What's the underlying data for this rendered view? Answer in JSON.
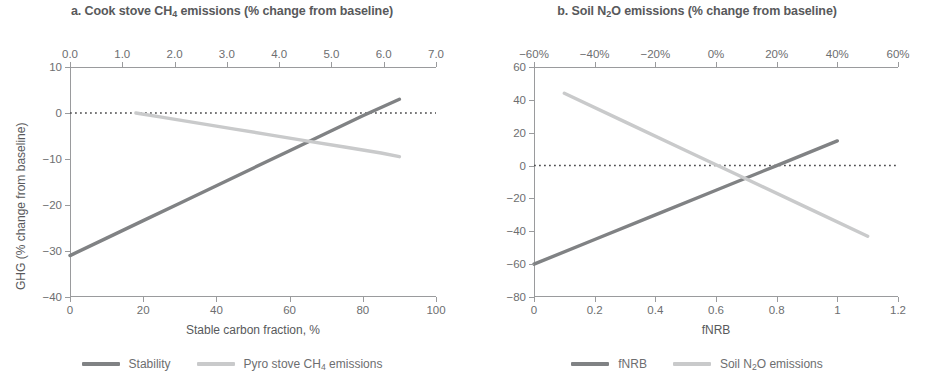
{
  "colors": {
    "series_dark": "#808284",
    "series_light": "#c9cacb",
    "axis": "#9a9b9d",
    "text": "#6d6e70",
    "title": "#58595b",
    "zero_line": "#4d4d4f",
    "background": "#ffffff"
  },
  "panels": [
    {
      "id": "a",
      "title_prefix": "a. Cook stove CH",
      "title_sub": "4",
      "title_suffix": " emissions (% change from baseline)",
      "title_full": "a. Cook stove CH4 emissions (% change from baseline)",
      "top_axis_ticks": [
        "0.0",
        "1.0",
        "2.0",
        "3.0",
        "4.0",
        "5.0",
        "6.0",
        "7.0"
      ],
      "bottom_axis_ticks": [
        "0",
        "20",
        "40",
        "60",
        "80",
        "100"
      ],
      "y_axis_ticks": [
        "10",
        "0",
        "-10",
        "-20",
        "-30",
        "-40"
      ],
      "x_axis_title": "Stable carbon fraction, %",
      "y_axis_title": "GHG (% change from baseline)",
      "legend": [
        {
          "label": "Stability",
          "color": "#808284",
          "style": "solid"
        },
        {
          "label_prefix": "Pyro stove CH",
          "label_sub": "4",
          "label_suffix": " emissions",
          "label": "Pyro stove CH4 emissions",
          "color": "#c9cacb",
          "style": "solid"
        }
      ]
    },
    {
      "id": "b",
      "title_prefix": "b. Soil N",
      "title_sub": "2",
      "title_suffix": "O emissions (% change from baseline)",
      "title_full": "b. Soil N2O emissions (% change from baseline)",
      "top_axis_ticks": [
        "-60%",
        "-40%",
        "-20%",
        "0%",
        "20%",
        "40%",
        "60%"
      ],
      "bottom_axis_ticks": [
        "0",
        "0.2",
        "0.4",
        "0.6",
        "0.8",
        "1",
        "1.2"
      ],
      "y_axis_ticks": [
        "60",
        "40",
        "20",
        "0",
        "-20",
        "-40",
        "-60",
        "-80"
      ],
      "x_axis_title": "fNRB",
      "y_axis_title": "GHG (% change from baseline)",
      "legend": [
        {
          "label": "fNRB",
          "color": "#808284",
          "style": "solid"
        },
        {
          "label_prefix": "Soil N",
          "label_sub": "2",
          "label_suffix": "O emissions",
          "label": "Soil N2O emissions",
          "color": "#c9cacb",
          "style": "solid"
        }
      ]
    }
  ],
  "chart_data": [
    {
      "type": "line",
      "panel": "a",
      "title": "a. Cook stove CH4 emissions (% change from baseline)",
      "xlabel": "Stable carbon fraction, %",
      "ylabel": "GHG (% change from baseline)",
      "xlim": [
        0,
        100
      ],
      "ylim": [
        -40,
        10
      ],
      "xticks": [
        0,
        20,
        40,
        60,
        80,
        100
      ],
      "yticks": [
        -40,
        -30,
        -20,
        -10,
        0,
        10
      ],
      "secondary_xaxis": {
        "position": "top",
        "lim": [
          0.0,
          7.0
        ],
        "ticks": [
          0.0,
          1.0,
          2.0,
          3.0,
          4.0,
          5.0,
          6.0,
          7.0
        ],
        "ticklabels": [
          "0.0",
          "1.0",
          "2.0",
          "3.0",
          "4.0",
          "5.0",
          "6.0",
          "7.0"
        ]
      },
      "grid": false,
      "legend_position": "bottom",
      "zero_reference_line": {
        "y": 0,
        "style": "dotted",
        "color": "#4d4d4f"
      },
      "series": [
        {
          "name": "Stability",
          "color": "#808284",
          "style": "solid",
          "x": [
            0,
            10,
            20,
            30,
            40,
            50,
            60,
            70,
            80,
            90
          ],
          "y": [
            -31.0,
            -27.2,
            -23.4,
            -19.6,
            -15.8,
            -12.0,
            -8.2,
            -4.4,
            -0.6,
            3.0
          ]
        },
        {
          "name": "Pyro stove CH4 emissions",
          "color": "#c9cacb",
          "style": "solid",
          "x": [
            18,
            25,
            35,
            45,
            55,
            65,
            75,
            85,
            90
          ],
          "y": [
            0.0,
            -0.9,
            -2.2,
            -3.5,
            -4.8,
            -6.1,
            -7.4,
            -8.7,
            -9.5
          ]
        }
      ]
    },
    {
      "type": "line",
      "panel": "b",
      "title": "b. Soil N2O emissions (% change from baseline)",
      "xlabel": "fNRB",
      "ylabel": "GHG (% change from baseline)",
      "xlim": [
        0,
        1.2
      ],
      "ylim": [
        -80,
        60
      ],
      "xticks": [
        0,
        0.2,
        0.4,
        0.6,
        0.8,
        1.0,
        1.2
      ],
      "yticks": [
        -80,
        -60,
        -40,
        -20,
        0,
        20,
        40,
        60
      ],
      "secondary_xaxis": {
        "position": "top",
        "lim": [
          -60,
          60
        ],
        "ticks": [
          -60,
          -40,
          -20,
          0,
          20,
          40,
          60
        ],
        "ticklabels": [
          "-60%",
          "-40%",
          "-20%",
          "0%",
          "20%",
          "40%",
          "60%"
        ]
      },
      "grid": false,
      "legend_position": "bottom",
      "zero_reference_line": {
        "y": 0,
        "style": "dotted",
        "color": "#4d4d4f"
      },
      "series": [
        {
          "name": "fNRB",
          "color": "#808284",
          "style": "solid",
          "x": [
            0.0,
            0.2,
            0.4,
            0.6,
            0.8,
            1.0
          ],
          "y": [
            -60.0,
            -45.0,
            -30.0,
            -15.0,
            0.0,
            15.0
          ]
        },
        {
          "name": "Soil N2O emissions",
          "color": "#c9cacb",
          "style": "solid",
          "x": [
            0.1,
            0.3,
            0.5,
            0.7,
            0.9,
            1.1
          ],
          "y": [
            44.0,
            26.6,
            9.2,
            -8.2,
            -25.6,
            -43.0
          ]
        }
      ]
    }
  ]
}
